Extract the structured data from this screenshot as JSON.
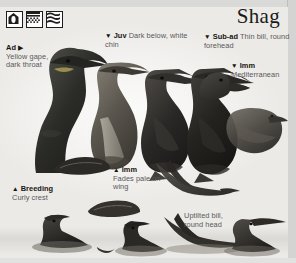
{
  "page": {
    "title": "Shag",
    "width": 296,
    "height": 263,
    "background": "#f7f6f4"
  },
  "habitat_icons": [
    {
      "name": "nest-site-icon",
      "label": "nest site"
    },
    {
      "name": "rocky-coast-icon",
      "label": "rocky coast"
    },
    {
      "name": "open-sea-icon",
      "label": "open sea"
    }
  ],
  "labels": {
    "ad": {
      "arrow": "▶",
      "arrow_position": "after",
      "lead": "Ad",
      "desc": "Yellow gape, dark throat"
    },
    "juv": {
      "arrow": "▼",
      "arrow_position": "before",
      "lead": "Juv",
      "desc": "Dark below, white chin"
    },
    "subad": {
      "arrow": "▼",
      "arrow_position": "before",
      "lead": "Sub-ad",
      "desc": "Thin bill, round forehead"
    },
    "imm_mediterranean": {
      "arrow": "▼",
      "arrow_position": "before",
      "lead": "Imm",
      "desc": "Mediterranean"
    },
    "imm_wing": {
      "arrow": "▲",
      "arrow_position": "before",
      "lead": "Imm",
      "desc": "Fades pale on wing"
    },
    "breeding": {
      "arrow": "▲",
      "arrow_position": "before",
      "lead": "Breeding",
      "desc": "Curly crest"
    },
    "uptilted": {
      "arrow": "",
      "arrow_position": "none",
      "lead": "",
      "desc": "Uptilted bill, round head"
    }
  },
  "illustrations": [
    {
      "name": "shag-adult-head",
      "caption": "Ad"
    },
    {
      "name": "shag-juvenile-standing",
      "caption": "Juv"
    },
    {
      "name": "shag-dark-standing",
      "caption": ""
    },
    {
      "name": "shag-subadult-standing",
      "caption": "Sub-ad"
    },
    {
      "name": "shag-immature-head",
      "caption": "Imm"
    },
    {
      "name": "shag-immature-perched",
      "caption": "Imm"
    },
    {
      "name": "shag-wing-detail-upper",
      "caption": "Breeding"
    },
    {
      "name": "shag-wing-detail-lower",
      "caption": ""
    },
    {
      "name": "shag-in-flight",
      "caption": "Imm"
    },
    {
      "name": "shag-swimming-left",
      "caption": ""
    },
    {
      "name": "shag-swimming-mid",
      "caption": ""
    },
    {
      "name": "shag-swimming-flying",
      "caption": ""
    },
    {
      "name": "shag-swimming-right",
      "caption": "Uptilted bill, round head"
    },
    {
      "name": "shag-distant-flying",
      "caption": ""
    }
  ],
  "colors": {
    "ink": "#15150f",
    "body_text": "#58585a",
    "plumage_dark": "#2e2e2c",
    "plumage_mid": "#6a6a66",
    "page_edge": "#d4d4d2"
  }
}
